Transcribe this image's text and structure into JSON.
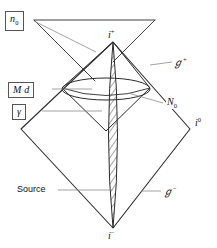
{
  "figure": {
    "type": "penrose-conformal-diagram",
    "background_color": "#ffffff",
    "line_color": "#222222",
    "leader_color": "#7a7a7a",
    "box_border_color": "#555555",
    "hatch_color": "#333333"
  },
  "labels": {
    "n0": "n",
    "n0_sub": "0",
    "md": "M d",
    "gamma": "γ",
    "source": "Source",
    "i_plus": "i",
    "i_plus_sup": "+",
    "i_minus": "i",
    "i_minus_sup": "−",
    "i_zero": "i",
    "i_zero_sup": "0",
    "scri_plus": "ℊ",
    "scri_plus_sup": "+",
    "scri_minus": "ℊ",
    "scri_minus_sup": "−",
    "N0": "N",
    "N0_sub": "0"
  },
  "geometry": {
    "outer_diamond": {
      "top": [
        113,
        42
      ],
      "right": [
        190,
        129
      ],
      "bottom": [
        113,
        228
      ],
      "left": [
        21,
        129
      ]
    },
    "inner_diamond": {
      "top": [
        113,
        42
      ],
      "right": [
        150,
        88
      ],
      "bottom": [
        106,
        131
      ],
      "left": [
        62,
        88
      ]
    },
    "lens_ellipse": {
      "center": [
        106,
        89
      ],
      "rx": 44,
      "ry": 11
    },
    "spindle": {
      "top": [
        113,
        42
      ],
      "bottom": [
        113,
        228
      ],
      "half_width": 8
    },
    "upper_chevron": {
      "apex_left": [
        34,
        20
      ],
      "right_end": [
        155,
        20
      ],
      "descend_to": [
        100,
        57
      ]
    }
  },
  "leaders": [
    {
      "name": "n0-leader",
      "from": [
        34,
        20
      ],
      "to": [
        93,
        50
      ]
    },
    {
      "name": "md-leader",
      "from": [
        52,
        89
      ],
      "to": [
        88,
        89
      ]
    },
    {
      "name": "gamma-leader",
      "from": [
        42,
        111
      ],
      "to": [
        100,
        111
      ]
    },
    {
      "name": "source-leader",
      "from": [
        58,
        190
      ],
      "to": [
        113,
        190
      ]
    },
    {
      "name": "N0-leader",
      "from": [
        160,
        103
      ],
      "to": [
        130,
        93
      ]
    },
    {
      "name": "scri-plus-leader",
      "from": [
        150,
        65
      ],
      "to": [
        170,
        63
      ]
    },
    {
      "name": "scri-minus-leader",
      "from": [
        140,
        190
      ],
      "to": [
        162,
        190
      ]
    }
  ]
}
